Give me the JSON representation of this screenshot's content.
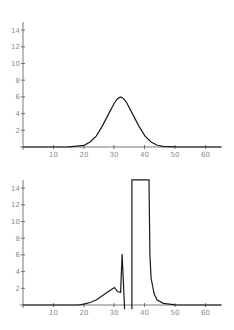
{
  "chart_data": [
    {
      "type": "line",
      "title": "",
      "xlabel": "",
      "ylabel": "",
      "xlim": [
        0,
        65
      ],
      "ylim": [
        0,
        15
      ],
      "xticks": [
        "10",
        "20",
        "30",
        "40",
        "50",
        "60"
      ],
      "yticks": [
        "2",
        "4",
        "6",
        "8",
        "10",
        "12",
        "14"
      ],
      "grid": false,
      "legend": null,
      "series": [
        {
          "name": "gaussian",
          "x": [
            0,
            10,
            15,
            20,
            22,
            24,
            26,
            28,
            30,
            31,
            32,
            33,
            34,
            36,
            38,
            40,
            42,
            44,
            46,
            50,
            55,
            65
          ],
          "y": [
            0,
            0,
            0.01,
            0.2,
            0.6,
            1.3,
            2.5,
            3.9,
            5.3,
            5.8,
            6.0,
            5.8,
            5.3,
            3.9,
            2.5,
            1.3,
            0.6,
            0.2,
            0.07,
            0.01,
            0,
            0
          ]
        }
      ]
    },
    {
      "type": "line",
      "title": "",
      "xlabel": "",
      "ylabel": "",
      "xlim": [
        0,
        65
      ],
      "ylim": [
        0,
        15
      ],
      "xticks": [
        "10",
        "20",
        "30",
        "40",
        "50",
        "60"
      ],
      "yticks": [
        "2",
        "4",
        "6",
        "8",
        "10",
        "12",
        "14"
      ],
      "grid": false,
      "legend": null,
      "series": [
        {
          "name": "divergent",
          "x": [
            0,
            10,
            18,
            20,
            22,
            24,
            26,
            28,
            30,
            31,
            32,
            32.5,
            33.3,
            33.3,
            35.7,
            35.7,
            41.3,
            41.6,
            42,
            43,
            44,
            46,
            50,
            65
          ],
          "y": [
            0,
            0,
            0,
            0.1,
            0.3,
            0.6,
            1.1,
            1.6,
            2.1,
            1.6,
            1.5,
            6.1,
            -0.5,
            null,
            -0.5,
            15,
            15,
            6.0,
            3.2,
            1.3,
            0.6,
            0.2,
            0.02,
            0
          ]
        }
      ]
    }
  ],
  "charts": {
    "top": {
      "xticks": [
        "10",
        "20",
        "30",
        "40",
        "50",
        "60"
      ],
      "yticks": [
        "2",
        "4",
        "6",
        "8",
        "10",
        "12",
        "14"
      ]
    },
    "bottom": {
      "xticks": [
        "10",
        "20",
        "30",
        "40",
        "50",
        "60"
      ],
      "yticks": [
        "2",
        "4",
        "6",
        "8",
        "10",
        "12",
        "14"
      ]
    }
  }
}
